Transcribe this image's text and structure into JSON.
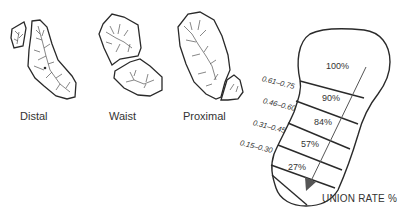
{
  "fracture_types": [
    {
      "label": "Distal"
    },
    {
      "label": "Waist"
    },
    {
      "label": "Proximal"
    }
  ],
  "scaphoid_zones": [
    {
      "union_rate": "100%",
      "ratio_range": ""
    },
    {
      "union_rate": "90%",
      "ratio_range": "0.61–0.75"
    },
    {
      "union_rate": "84%",
      "ratio_range": "0.46–0.60"
    },
    {
      "union_rate": "57%",
      "ratio_range": "0.31–0.45"
    },
    {
      "union_rate": "27%",
      "ratio_range": "0.15–0.30"
    }
  ],
  "axis_label": "UNION RATE %",
  "colors": {
    "outline": "#2a2a2a",
    "arrow": "#555555",
    "text": "#333333"
  }
}
